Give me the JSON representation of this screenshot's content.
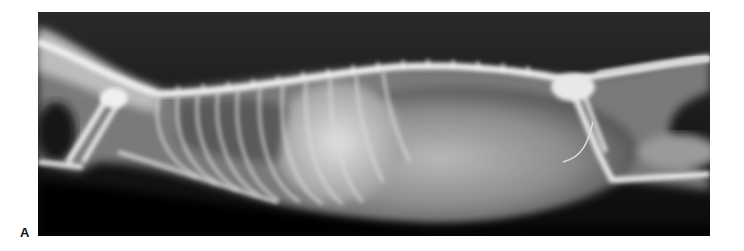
{
  "figure": {
    "panel_label": "A",
    "image": {
      "type": "radiograph",
      "view": "lateral",
      "subject": "cat thorax and abdomen",
      "alt": "Lateral radiograph of a cat showing spine, ribs, thorax, abdomen, forelimbs and hindlimbs"
    },
    "colors": {
      "background": "#ffffff",
      "film": "#050505",
      "soft_tissue": "#8a8a8a",
      "bone": "#f2f2f2"
    }
  }
}
